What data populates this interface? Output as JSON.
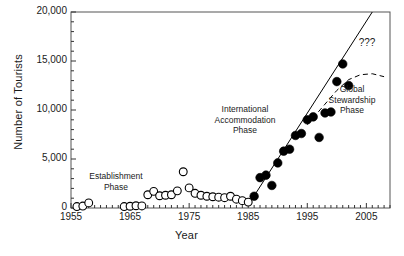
{
  "chart_data": {
    "type": "scatter",
    "title": "",
    "xlabel": "Year",
    "ylabel": "Number of Tourists",
    "xlim": [
      1955,
      2009
    ],
    "ylim": [
      0,
      20000
    ],
    "grid": false,
    "legend": "none",
    "y_ticks_major": [
      0,
      5000,
      10000,
      15000,
      20000
    ],
    "y_tick_labels": [
      "0",
      "5,000",
      "10,000",
      "15,000",
      "20,000"
    ],
    "y_minor_step": 1000,
    "x_ticks_major": [
      1955,
      1965,
      1975,
      1985,
      1995,
      2005
    ],
    "x_tick_labels": [
      "1955",
      "1965",
      "1975",
      "1985",
      "1995",
      "2005"
    ],
    "x_minor_step": 1,
    "series": [
      {
        "name": "Establishment Phase",
        "marker": "open-circle",
        "color": "#000000",
        "points": [
          {
            "x": 1956,
            "y": 150
          },
          {
            "x": 1957,
            "y": 200
          },
          {
            "x": 1958,
            "y": 520
          },
          {
            "x": 1964,
            "y": 150
          },
          {
            "x": 1965,
            "y": 180
          },
          {
            "x": 1966,
            "y": 230
          },
          {
            "x": 1967,
            "y": 210
          },
          {
            "x": 1968,
            "y": 1350
          },
          {
            "x": 1969,
            "y": 1700
          },
          {
            "x": 1970,
            "y": 1250
          },
          {
            "x": 1971,
            "y": 1300
          },
          {
            "x": 1972,
            "y": 1350
          },
          {
            "x": 1973,
            "y": 1750
          },
          {
            "x": 1974,
            "y": 3700
          },
          {
            "x": 1975,
            "y": 2050
          },
          {
            "x": 1976,
            "y": 1500
          },
          {
            "x": 1977,
            "y": 1300
          },
          {
            "x": 1978,
            "y": 1200
          },
          {
            "x": 1979,
            "y": 1150
          },
          {
            "x": 1980,
            "y": 1100
          },
          {
            "x": 1981,
            "y": 1050
          },
          {
            "x": 1982,
            "y": 1200
          },
          {
            "x": 1983,
            "y": 900
          },
          {
            "x": 1984,
            "y": 750
          },
          {
            "x": 1985,
            "y": 600
          }
        ]
      },
      {
        "name": "International Accommodation Phase",
        "marker": "filled-circle",
        "color": "#000000",
        "points": [
          {
            "x": 1986,
            "y": 1200
          },
          {
            "x": 1987,
            "y": 3100
          },
          {
            "x": 1988,
            "y": 3350
          },
          {
            "x": 1989,
            "y": 2300
          },
          {
            "x": 1990,
            "y": 4600
          },
          {
            "x": 1991,
            "y": 5800
          },
          {
            "x": 1992,
            "y": 6000
          },
          {
            "x": 1993,
            "y": 7400
          },
          {
            "x": 1994,
            "y": 7600
          },
          {
            "x": 1995,
            "y": 9000
          },
          {
            "x": 1996,
            "y": 9300
          },
          {
            "x": 1997,
            "y": 7200
          },
          {
            "x": 1998,
            "y": 9700
          },
          {
            "x": 1999,
            "y": 9800
          },
          {
            "x": 2000,
            "y": 12900
          },
          {
            "x": 2001,
            "y": 14700
          },
          {
            "x": 2002,
            "y": 12500
          }
        ]
      }
    ],
    "trend_lines": [
      {
        "name": "linear-projection",
        "style": "solid",
        "color": "#000000",
        "points": [
          {
            "x": 1985,
            "y": 300
          },
          {
            "x": 2006,
            "y": 20000
          }
        ]
      },
      {
        "name": "global-stewardship-curve",
        "style": "dashed",
        "color": "#000000",
        "points": [
          {
            "x": 1995,
            "y": 8500
          },
          {
            "x": 1998,
            "y": 10600
          },
          {
            "x": 2000,
            "y": 12000
          },
          {
            "x": 2002,
            "y": 13100
          },
          {
            "x": 2004,
            "y": 13600
          },
          {
            "x": 2006,
            "y": 13700
          },
          {
            "x": 2008,
            "y": 13400
          }
        ]
      }
    ],
    "annotations": [
      {
        "name": "establishment-phase-label",
        "text": "Establishment\nPhase"
      },
      {
        "name": "international-accommodation-phase-label",
        "text": "International\nAccommodation\nPhase"
      },
      {
        "name": "global-stewardship-phase-label",
        "text": "Global\nStewardship\nPhase"
      },
      {
        "name": "uncertainty-label",
        "text": "???"
      }
    ]
  },
  "axes": {
    "y_title": "Number of Tourists",
    "x_title": "Year",
    "y_labels": [
      "20,000",
      "15,000",
      "10,000",
      "5,000",
      "0"
    ],
    "x_labels": [
      "1955",
      "1965",
      "1975",
      "1985",
      "1995",
      "2005"
    ]
  },
  "labels": {
    "establishment": "Establishment\nPhase",
    "international": "International\nAccommodation\nPhase",
    "global": "Global\nStewardship\nPhase",
    "question": "???"
  }
}
